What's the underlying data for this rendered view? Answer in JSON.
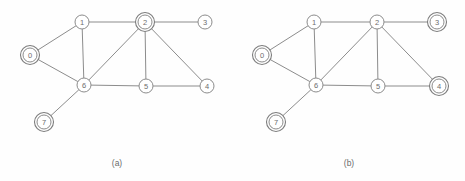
{
  "figure": {
    "background_color": "#fefefe",
    "stroke_color": "#8c8c8c",
    "label_color": "#6e6e6e",
    "node_radius": 7,
    "ring_radius": 9.5
  },
  "chart_data": {
    "type": "diagram",
    "title": "",
    "subtitle": "",
    "xlabel": "",
    "ylabel": "",
    "panels": [
      {
        "caption": "(a)",
        "caption_x": 117,
        "caption_y": 163,
        "nodes": [
          {
            "id": "0",
            "label": "0",
            "x": 30,
            "y": 55,
            "marked": true
          },
          {
            "id": "1",
            "label": "1",
            "x": 82,
            "y": 22,
            "marked": false
          },
          {
            "id": "2",
            "label": "2",
            "x": 145,
            "y": 22,
            "marked": true
          },
          {
            "id": "3",
            "label": "3",
            "x": 205,
            "y": 22,
            "marked": false
          },
          {
            "id": "4",
            "label": "4",
            "x": 207,
            "y": 86,
            "marked": false
          },
          {
            "id": "5",
            "label": "5",
            "x": 146,
            "y": 86,
            "marked": false
          },
          {
            "id": "6",
            "label": "6",
            "x": 84,
            "y": 85,
            "marked": false
          },
          {
            "id": "7",
            "label": "7",
            "x": 44,
            "y": 122,
            "marked": true
          }
        ],
        "edges": [
          [
            "0",
            "1"
          ],
          [
            "0",
            "6"
          ],
          [
            "1",
            "2"
          ],
          [
            "1",
            "6"
          ],
          [
            "2",
            "3"
          ],
          [
            "2",
            "4"
          ],
          [
            "2",
            "5"
          ],
          [
            "2",
            "6"
          ],
          [
            "5",
            "6"
          ],
          [
            "4",
            "5"
          ],
          [
            "6",
            "7"
          ]
        ]
      },
      {
        "caption": "(b)",
        "caption_x": 349,
        "caption_y": 163,
        "nodes": [
          {
            "id": "0",
            "label": "0",
            "x": 262,
            "y": 55,
            "marked": true
          },
          {
            "id": "1",
            "label": "1",
            "x": 314,
            "y": 22,
            "marked": false
          },
          {
            "id": "2",
            "label": "2",
            "x": 377,
            "y": 22,
            "marked": false
          },
          {
            "id": "3",
            "label": "3",
            "x": 437,
            "y": 22,
            "marked": true
          },
          {
            "id": "4",
            "label": "4",
            "x": 439,
            "y": 86,
            "marked": true
          },
          {
            "id": "5",
            "label": "5",
            "x": 378,
            "y": 86,
            "marked": false
          },
          {
            "id": "6",
            "label": "6",
            "x": 316,
            "y": 85,
            "marked": false
          },
          {
            "id": "7",
            "label": "7",
            "x": 276,
            "y": 122,
            "marked": true
          }
        ],
        "edges": [
          [
            "0",
            "1"
          ],
          [
            "0",
            "6"
          ],
          [
            "1",
            "2"
          ],
          [
            "1",
            "6"
          ],
          [
            "2",
            "3"
          ],
          [
            "2",
            "4"
          ],
          [
            "2",
            "5"
          ],
          [
            "2",
            "6"
          ],
          [
            "5",
            "6"
          ],
          [
            "4",
            "5"
          ],
          [
            "6",
            "7"
          ]
        ]
      }
    ]
  }
}
